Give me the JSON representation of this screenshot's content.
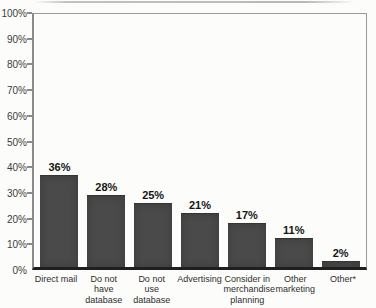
{
  "figure": {
    "background_color": "#fcfcfa"
  },
  "chart_data": {
    "type": "bar",
    "title": "",
    "xlabel": "",
    "ylabel": "",
    "categories": [
      "Direct mail",
      "Do not\nhave\ndatabase",
      "Do not\nuse\ndatabase",
      "Advertising",
      "Consider in\nmerchandise\nplanning",
      "Other\nmarketing",
      "Other*"
    ],
    "values": [
      36,
      28,
      25,
      21,
      17,
      11,
      2
    ],
    "value_labels": [
      "36%",
      "28%",
      "25%",
      "21%",
      "17%",
      "11%",
      "2%"
    ],
    "ylim": [
      0,
      100
    ],
    "ytick_interval": 10,
    "ytick_labels": [
      "100%",
      "90%",
      "80%",
      "70%",
      "60%",
      "50%",
      "40%",
      "30%",
      "20%",
      "10%",
      "0%"
    ],
    "grid": false,
    "legend": "none",
    "colors": {
      "bar_fill": "#4a4a4a",
      "baseline_axis": "#1f1f1f",
      "frame": "#9a9a9a",
      "tick": "#8a8a8a",
      "value_label_text": "#151515",
      "axis_label_text": "#3d3d3d",
      "category_label_text": "#2e2e2e"
    }
  }
}
